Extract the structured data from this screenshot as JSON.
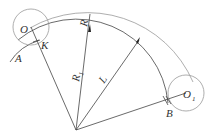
{
  "diagram": {
    "labels": {
      "O": "O",
      "K": "K",
      "A": "A",
      "R": "R",
      "R1": "R",
      "R1_sub": "1",
      "L": "L",
      "B": "B",
      "O1": "O",
      "O1_sub": "1"
    }
  }
}
